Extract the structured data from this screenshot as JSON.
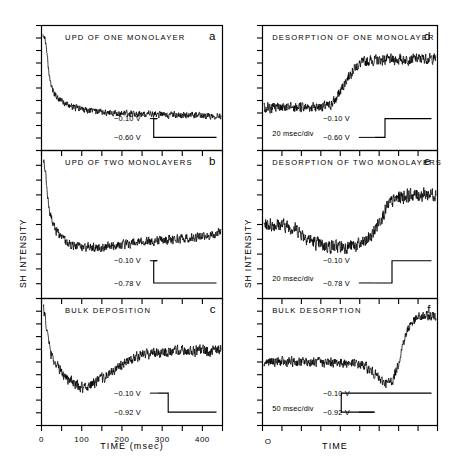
{
  "figure": {
    "axis_labels": {
      "y_left": "SH INTENSITY",
      "y_right": "SH INTENSITY",
      "x_left": "TIME (msec)",
      "x_right": "TIME",
      "x_right_origin": "O"
    },
    "x_ticks_left": [
      "0",
      "100",
      "200",
      "300",
      "400"
    ]
  },
  "panels": {
    "a": {
      "letter": "a",
      "title": "UPD OF ONE MONOLAYER",
      "v_high": "−0.10 V",
      "v_low": "−0.60 V",
      "timebase": ""
    },
    "b": {
      "letter": "b",
      "title": "UPD OF TWO MONOLAYERS",
      "v_high": "−0.10 V",
      "v_low": "−0.78 V",
      "timebase": ""
    },
    "c": {
      "letter": "c",
      "title": "BULK DEPOSITION",
      "v_high": "−0.10 V",
      "v_low": "−0.92 V",
      "timebase": ""
    },
    "d": {
      "letter": "d",
      "title": "DESORPTION OF ONE MONOLAYER",
      "v_high": "−0.10 V",
      "v_low": "−0.60 V",
      "timebase": "20 msec/div"
    },
    "e": {
      "letter": "e",
      "title": "DESORPTION OF TWO MONOLAYERS",
      "v_high": "−0.10 V",
      "v_low": "−0.78 V",
      "timebase": "20 msec/div"
    },
    "f": {
      "letter": "f",
      "title": "BULK DESORPTION",
      "v_high": "−0.10 V",
      "v_low": "−0.92 V",
      "timebase": "50 msec/div"
    }
  },
  "chart_data": {
    "type": "line",
    "xlabel": "TIME (msec)",
    "ylabel": "SH INTENSITY",
    "grid": false,
    "legend": "none",
    "line_color": "#000000",
    "panels": [
      {
        "id": "a",
        "label": "UPD OF ONE MONOLAYER",
        "xlabel": "TIME (msec)",
        "ylabel": "SH INTENSITY",
        "xlim": [
          0,
          450
        ],
        "xticks": [
          0,
          50,
          100,
          150,
          200,
          250,
          300,
          350,
          400,
          450
        ],
        "noise_amplitude": 0.035,
        "step_waveform": {
          "high": -0.1,
          "low": -0.6,
          "direction": "down",
          "step_x_frac": 0.62
        },
        "x": [
          0,
          5,
          10,
          15,
          20,
          30,
          40,
          55,
          70,
          90,
          110,
          140,
          170,
          200,
          240,
          280,
          320,
          360,
          400,
          450
        ],
        "y": [
          1.0,
          0.96,
          0.8,
          0.62,
          0.52,
          0.44,
          0.4,
          0.36,
          0.335,
          0.315,
          0.3,
          0.285,
          0.275,
          0.268,
          0.262,
          0.258,
          0.255,
          0.252,
          0.25,
          0.249
        ]
      },
      {
        "id": "b",
        "label": "UPD OF TWO MONOLAYERS",
        "xlabel": "TIME (msec)",
        "ylabel": "SH INTENSITY",
        "xlim": [
          0,
          450
        ],
        "xticks": [
          0,
          50,
          100,
          150,
          200,
          250,
          300,
          350,
          400,
          450
        ],
        "noise_amplitude": 0.04,
        "step_waveform": {
          "high": -0.1,
          "low": -0.78,
          "direction": "down",
          "step_x_frac": 0.62
        },
        "x": [
          0,
          5,
          10,
          15,
          25,
          40,
          60,
          80,
          100,
          130,
          160,
          200,
          240,
          280,
          320,
          360,
          400,
          440,
          450
        ],
        "y": [
          1.0,
          0.95,
          0.78,
          0.62,
          0.5,
          0.42,
          0.365,
          0.335,
          0.325,
          0.322,
          0.33,
          0.345,
          0.36,
          0.375,
          0.385,
          0.395,
          0.405,
          0.43,
          0.46
        ]
      },
      {
        "id": "c",
        "label": "BULK DEPOSITION",
        "xlabel": "TIME (msec)",
        "ylabel": "SH INTENSITY",
        "xlim": [
          0,
          450
        ],
        "xticks": [
          0,
          50,
          100,
          150,
          200,
          250,
          300,
          350,
          400,
          450
        ],
        "noise_amplitude": 0.055,
        "step_waveform": {
          "high": -0.1,
          "low": -0.92,
          "direction": "down",
          "step_x_frac": 0.7
        },
        "x": [
          0,
          5,
          12,
          20,
          30,
          45,
          60,
          80,
          95,
          110,
          130,
          150,
          175,
          200,
          225,
          250,
          280,
          320,
          360,
          400,
          440,
          450
        ],
        "y": [
          1.0,
          0.92,
          0.72,
          0.58,
          0.5,
          0.42,
          0.36,
          0.3,
          0.275,
          0.28,
          0.31,
          0.35,
          0.41,
          0.47,
          0.53,
          0.565,
          0.585,
          0.595,
          0.6,
          0.6,
          0.6,
          0.62
        ]
      },
      {
        "id": "d",
        "label": "DESORPTION OF ONE MONOLAYER",
        "xlabel": "TIME",
        "ylabel": "SH INTENSITY",
        "timebase": "20 msec/div",
        "noise_amplitude": 0.055,
        "step_waveform": {
          "high": -0.1,
          "low": -0.6,
          "direction": "up",
          "step_x_frac": 0.7
        },
        "x": [
          0,
          0.1,
          0.2,
          0.3,
          0.38,
          0.42,
          0.46,
          0.5,
          0.54,
          0.58,
          0.62,
          0.7,
          0.8,
          0.9,
          1.0
        ],
        "y": [
          0.32,
          0.32,
          0.325,
          0.33,
          0.335,
          0.4,
          0.52,
          0.63,
          0.7,
          0.735,
          0.75,
          0.755,
          0.76,
          0.765,
          0.77
        ]
      },
      {
        "id": "e",
        "label": "DESORPTION OF TWO MONOLAYERS",
        "xlabel": "TIME",
        "ylabel": "SH INTENSITY",
        "timebase": "20 msec/div",
        "noise_amplitude": 0.06,
        "step_waveform": {
          "high": -0.1,
          "low": -0.78,
          "direction": "up",
          "step_x_frac": 0.74
        },
        "x": [
          0,
          0.06,
          0.12,
          0.18,
          0.24,
          0.3,
          0.36,
          0.44,
          0.52,
          0.58,
          0.63,
          0.68,
          0.73,
          0.78,
          0.85,
          0.92,
          1.0
        ],
        "y": [
          0.5,
          0.5,
          0.495,
          0.47,
          0.41,
          0.355,
          0.335,
          0.33,
          0.335,
          0.355,
          0.42,
          0.55,
          0.66,
          0.71,
          0.725,
          0.73,
          0.735
        ]
      },
      {
        "id": "f",
        "label": "BULK DESORPTION",
        "xlabel": "TIME",
        "ylabel": "SH INTENSITY",
        "timebase": "50 msec/div",
        "noise_amplitude": 0.05,
        "step_waveform": {
          "high": -0.1,
          "low": -0.92,
          "direction": "up",
          "step_x_frac": 0.45
        },
        "x": [
          0,
          0.1,
          0.2,
          0.3,
          0.4,
          0.5,
          0.58,
          0.64,
          0.68,
          0.72,
          0.75,
          0.78,
          0.81,
          0.85,
          0.9,
          0.95,
          1.0
        ],
        "y": [
          0.5,
          0.5,
          0.5,
          0.498,
          0.495,
          0.49,
          0.47,
          0.4,
          0.33,
          0.31,
          0.34,
          0.48,
          0.68,
          0.84,
          0.9,
          0.91,
          0.915
        ]
      }
    ]
  }
}
